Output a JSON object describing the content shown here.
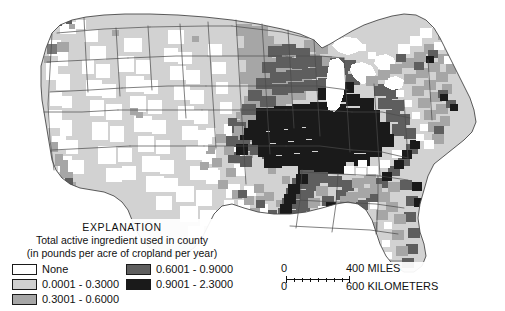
{
  "map": {
    "kind": "choropleth-county-map",
    "region": "Conterminous United States",
    "background_color": "#ffffff",
    "outline_color": "#4a4a4a",
    "water_color": "#ffffff"
  },
  "legend": {
    "title": "EXPLANATION",
    "subtitle_line1": "Total active ingredient used in county",
    "subtitle_line2": "(in pounds per acre of cropland per year)",
    "classes": [
      {
        "label": "None",
        "color": "#ffffff",
        "column": "left"
      },
      {
        "label": "0.0001 - 0.3000",
        "color": "#d0d0d0",
        "column": "left"
      },
      {
        "label": "0.3001 - 0.6000",
        "color": "#a6a6a6",
        "column": "left"
      },
      {
        "label": "0.6001 - 0.9000",
        "color": "#5e5e5e",
        "column": "right"
      },
      {
        "label": "0.9001 - 2.3000",
        "color": "#1a1a1a",
        "column": "right"
      }
    ]
  },
  "scale": {
    "miles": {
      "zero": "0",
      "caption": "400 MILES"
    },
    "kilometers": {
      "zero": "0",
      "caption": "600 KILOMETERS"
    }
  }
}
